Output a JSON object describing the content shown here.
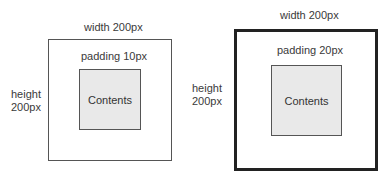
{
  "diagrams": [
    {
      "width_label": "width 200px",
      "padding_label": "padding 10px",
      "height_label_line1": "height",
      "height_label_line2": "200px",
      "contents_label": "Contents",
      "border": "thin"
    },
    {
      "width_label": "width 200px",
      "padding_label": "padding 20px",
      "height_label_line1": "height",
      "height_label_line2": "200px",
      "contents_label": "Contents",
      "border": "thick"
    }
  ],
  "colors": {
    "content_fill": "#e9e9e9",
    "border": "#555555",
    "thick_border": "#222222"
  }
}
